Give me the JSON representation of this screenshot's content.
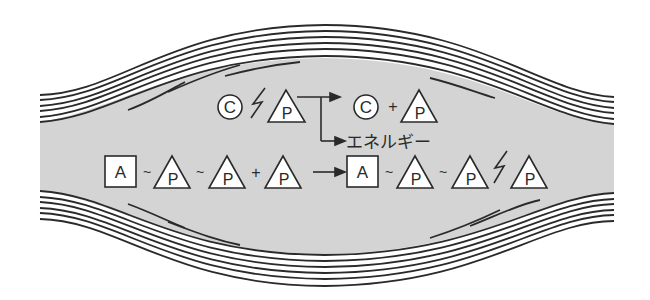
{
  "diagram": {
    "colors": {
      "background": "#ffffff",
      "muscle_fill": "#d4d4d4",
      "stroke": "#2a2a2a",
      "symbol_fill": "#ffffff"
    },
    "reaction_top": {
      "reactant_creatine": "C",
      "reactant_phosphate": "P",
      "high_energy_bond_icon": "lightning-bond",
      "product_creatine": "C",
      "plus": "+",
      "product_phosphate": "P",
      "energy_label": "エネルギー"
    },
    "reaction_bottom": {
      "reactant_adenosine": "A",
      "reactant_bond_1": "~",
      "reactant_phosphate_1": "P",
      "reactant_bond_2": "~",
      "reactant_phosphate_2": "P",
      "plus": "+",
      "reactant_phosphate_3": "P",
      "product_adenosine": "A",
      "product_bond_1": "~",
      "product_phosphate_1": "P",
      "product_bond_2": "~",
      "product_phosphate_2": "P",
      "high_energy_bond_icon": "lightning-bond",
      "product_phosphate_3": "P"
    }
  }
}
